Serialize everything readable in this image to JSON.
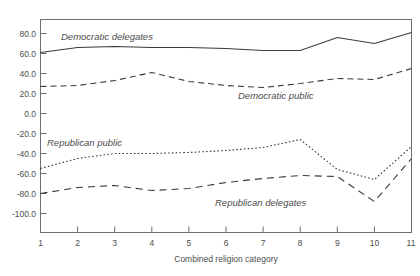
{
  "figure": {
    "clipped_top_text": "",
    "plot_background": "#ffffff",
    "line_color": "#3a3a3a",
    "axis_color": "#6e6e6e"
  },
  "axes": {
    "x_axis_title": "Combined religion category",
    "x_tick_labels": [
      "1",
      "2",
      "3",
      "4",
      "5",
      "6",
      "7",
      "8",
      "9",
      "10",
      "11"
    ],
    "y_tick_labels": [
      "80.0",
      "60.0",
      "40.0",
      "20.0",
      "0.0",
      "-20.0",
      "-40.0",
      "-60.0",
      "-80.0",
      "-100.0"
    ]
  },
  "series_labels": {
    "democratic_delegates": "Democratic delegates",
    "democratic_public": "Democratic public",
    "republican_public": "Republican public",
    "republican_delegates": "Republican delegates"
  },
  "chart_data": {
    "type": "line",
    "title": "",
    "xlabel": "Combined religion category",
    "ylabel": "",
    "x": [
      1,
      2,
      3,
      4,
      5,
      6,
      7,
      8,
      9,
      10,
      11
    ],
    "xlim": [
      1,
      11
    ],
    "ylim": [
      -110,
      88
    ],
    "xticks": [
      1,
      2,
      3,
      4,
      5,
      6,
      7,
      8,
      9,
      10,
      11
    ],
    "yticks": [
      80,
      60,
      40,
      20,
      0,
      -20,
      -40,
      -60,
      -80,
      -100
    ],
    "grid": false,
    "legend": "inline-annotations",
    "series": [
      {
        "name": "Democratic delegates",
        "style": "solid",
        "values": [
          61,
          66,
          67,
          66,
          66,
          65,
          63,
          63,
          76,
          70,
          81
        ]
      },
      {
        "name": "Democratic public",
        "style": "dashed",
        "values": [
          27,
          28,
          33,
          41,
          32,
          28,
          26,
          30,
          35,
          34,
          45
        ]
      },
      {
        "name": "Republican public",
        "style": "dotted",
        "values": [
          -55,
          -45,
          -40,
          -40,
          -39,
          -37,
          -34,
          -26,
          -56,
          -66,
          -33
        ]
      },
      {
        "name": "Republican delegates",
        "style": "dashed",
        "values": [
          -80,
          -74,
          -72,
          -77,
          -75,
          -69,
          -65,
          -62,
          -63,
          -88,
          -45
        ]
      }
    ]
  }
}
